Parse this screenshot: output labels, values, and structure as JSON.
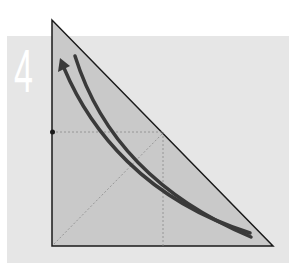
{
  "figure": {
    "step_number": "4",
    "colors": {
      "panel_background": "#e6e6e6",
      "triangle_fill": "#c9c9c9",
      "triangle_stroke": "#1a1a1a",
      "arrow_color": "#3a3a3a",
      "guide_line_color": "#8a8a8a",
      "numeral_color": "#ffffff"
    },
    "elements": [
      {
        "name": "right-triangle",
        "description": "Right triangle with vertical left leg and horizontal base"
      },
      {
        "name": "curved-arrow",
        "description": "Curved arrow pointing up toward apex"
      },
      {
        "name": "curved-line",
        "description": "Curved line parallel to arrow"
      },
      {
        "name": "guide-lines",
        "description": "Dotted horizontal, vertical and diagonal guide lines"
      },
      {
        "name": "marker-dot",
        "description": "Dot on left leg at guide line"
      }
    ]
  }
}
